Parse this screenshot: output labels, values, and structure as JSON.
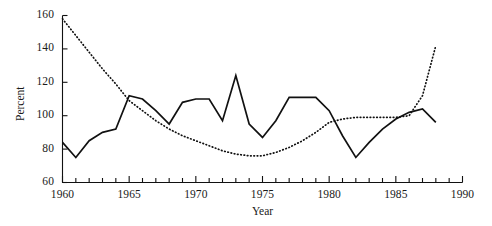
{
  "chart_data": {
    "type": "line",
    "title": "",
    "xlabel": "Year",
    "ylabel": "Percent",
    "xlim": [
      1960,
      1990
    ],
    "ylim": [
      60,
      160
    ],
    "xticks": [
      1960,
      1965,
      1970,
      1975,
      1980,
      1985,
      1990
    ],
    "xticklabels": [
      "1960",
      "1965",
      "1970",
      "1975",
      "1980",
      "1985",
      "1990"
    ],
    "yticks": [
      60,
      80,
      100,
      120,
      140,
      160
    ],
    "yticklabels": [
      "60",
      "80",
      "100",
      "120",
      "140",
      "160"
    ],
    "minor_xtick_interval": 1,
    "grid": false,
    "legend": "none",
    "x": [
      1960,
      1961,
      1962,
      1963,
      1964,
      1965,
      1966,
      1967,
      1968,
      1969,
      1970,
      1971,
      1972,
      1973,
      1974,
      1975,
      1976,
      1977,
      1978,
      1979,
      1980,
      1981,
      1982,
      1983,
      1984,
      1985,
      1986,
      1987,
      1988
    ],
    "series": [
      {
        "name": "solid-series",
        "style": "solid",
        "values": [
          84,
          75,
          85,
          90,
          92,
          112,
          110,
          103,
          95,
          108,
          110,
          110,
          97,
          124,
          95,
          87,
          97,
          111,
          111,
          111,
          103,
          88,
          75,
          84,
          92,
          98,
          102,
          104,
          96
        ]
      },
      {
        "name": "dotted-series",
        "style": "dotted",
        "values": [
          158,
          148,
          138,
          128,
          119,
          109,
          103,
          97,
          92,
          88,
          85,
          82,
          79,
          77,
          76,
          76,
          78,
          81,
          85,
          90,
          96,
          98,
          99,
          99,
          99,
          99,
          100,
          112,
          142
        ]
      }
    ]
  }
}
